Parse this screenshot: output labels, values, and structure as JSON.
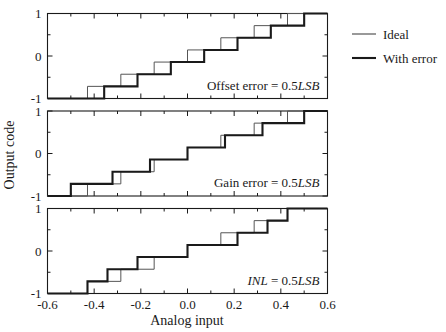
{
  "figure": {
    "width": 446,
    "height": 332,
    "background": "#ffffff",
    "ink_color": "#1a1a1a",
    "ideal_color": "#555555"
  },
  "axes": {
    "xlabel": "Analog input",
    "ylabel": "Output code",
    "xlim": [
      -0.6,
      0.6
    ],
    "ylim": [
      -1,
      1
    ],
    "xticks": [
      -0.6,
      -0.4,
      -0.2,
      0.0,
      0.2,
      0.4,
      0.6
    ],
    "xtick_labels": [
      "-0.6",
      "-0.4",
      "-0.2",
      "0.0",
      "0.2",
      "0.4",
      "0.6"
    ],
    "yticks": [
      -1,
      0,
      1
    ],
    "ytick_labels": [
      "-1",
      "0",
      "1"
    ],
    "x_minor_step": 0.1,
    "y_minor_step": 0.5,
    "grid": false
  },
  "legend": {
    "position": "right",
    "entries": [
      {
        "label": "Ideal",
        "style": "thin",
        "color": "#555555"
      },
      {
        "label": "With error",
        "style": "thick",
        "color": "#1a1a1a"
      }
    ]
  },
  "panels": [
    {
      "id": "offset-error",
      "annotation_prefix": "Offset error = 0.5",
      "annotation_unit": "LSB",
      "annotation_italic_prefix": false
    },
    {
      "id": "gain-error",
      "annotation_prefix": "Gain error = 0.5",
      "annotation_unit": "LSB",
      "annotation_italic_prefix": false
    },
    {
      "id": "inl",
      "annotation_prefix": "INL",
      "annotation_prefix_tail": " = 0.5",
      "annotation_unit": "LSB",
      "annotation_italic_prefix": true
    }
  ],
  "chart_data": {
    "type": "line",
    "title": "",
    "xlabel": "Analog input",
    "ylabel": "Output code",
    "xlim": [
      -0.6,
      0.6
    ],
    "ylim": [
      -1,
      1
    ],
    "xticks": [
      -0.6,
      -0.4,
      -0.2,
      0.0,
      0.2,
      0.4,
      0.6
    ],
    "yticks": [
      -1,
      0,
      1
    ],
    "grid": false,
    "legend": [
      "Ideal",
      "With error"
    ],
    "legend_position": "right-outside",
    "subplots": [
      {
        "name": "Offset error = 0.5LSB",
        "annotation": "Offset error = 0.5LSB",
        "series": [
          {
            "name": "Ideal",
            "style": "thin",
            "type": "step",
            "step_edges_x": [
              -0.4286,
              -0.2857,
              -0.1429,
              0.0,
              0.1429,
              0.2857,
              0.4286
            ],
            "step_levels_y": [
              -1.0,
              -0.7143,
              -0.4286,
              -0.1429,
              0.1429,
              0.4286,
              0.7143,
              1.0
            ],
            "x_start": -0.6,
            "x_end": 0.6
          },
          {
            "name": "With error",
            "style": "thick",
            "type": "step",
            "step_edges_x": [
              -0.3571,
              -0.2143,
              -0.0714,
              0.0714,
              0.2143,
              0.3571,
              0.5
            ],
            "step_levels_y": [
              -1.0,
              -0.7143,
              -0.4286,
              -0.1429,
              0.1429,
              0.4286,
              0.7143,
              1.0
            ],
            "x_start": -0.6,
            "x_end": 0.6
          }
        ]
      },
      {
        "name": "Gain error = 0.5LSB",
        "annotation": "Gain error = 0.5LSB",
        "series": [
          {
            "name": "Ideal",
            "style": "thin",
            "type": "step",
            "step_edges_x": [
              -0.4286,
              -0.2857,
              -0.1429,
              0.0,
              0.1429,
              0.2857,
              0.4286
            ],
            "step_levels_y": [
              -1.0,
              -0.7143,
              -0.4286,
              -0.1429,
              0.1429,
              0.4286,
              0.7143,
              1.0
            ],
            "x_start": -0.6,
            "x_end": 0.6
          },
          {
            "name": "With error",
            "style": "thick",
            "type": "step",
            "step_edges_x": [
              -0.5,
              -0.3214,
              -0.1607,
              0.0,
              0.1607,
              0.3214,
              0.5
            ],
            "step_levels_y": [
              -1.0,
              -0.7143,
              -0.4286,
              -0.1429,
              0.1429,
              0.4286,
              0.7143,
              1.0
            ],
            "x_start": -0.6,
            "x_end": 0.6
          }
        ]
      },
      {
        "name": "INL = 0.5LSB",
        "annotation": "INL = 0.5LSB",
        "series": [
          {
            "name": "Ideal",
            "style": "thin",
            "type": "step",
            "step_edges_x": [
              -0.4286,
              -0.2857,
              -0.1429,
              0.0,
              0.1429,
              0.2857,
              0.4286
            ],
            "step_levels_y": [
              -1.0,
              -0.7143,
              -0.4286,
              -0.1429,
              0.1429,
              0.4286,
              0.7143,
              1.0
            ],
            "x_start": -0.6,
            "x_end": 0.6
          },
          {
            "name": "With error",
            "style": "thick",
            "type": "step",
            "step_edges_x": [
              -0.4286,
              -0.3429,
              -0.2143,
              0.0,
              0.2143,
              0.3429,
              0.4286
            ],
            "step_levels_y": [
              -1.0,
              -0.7143,
              -0.4286,
              -0.1429,
              0.1429,
              0.4286,
              0.7143,
              1.0
            ],
            "x_start": -0.6,
            "x_end": 0.6
          }
        ]
      }
    ]
  }
}
